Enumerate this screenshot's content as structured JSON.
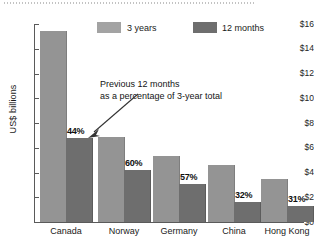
{
  "chart_data": {
    "type": "bar",
    "title": "",
    "xlabel": "",
    "ylabel": "US$ billions",
    "ylim": [
      0,
      16
    ],
    "grid": false,
    "legend_position": "top",
    "categories": [
      "Canada",
      "Norway",
      "Germany",
      "China",
      "Hong Kong"
    ],
    "series": [
      {
        "name": "3 years",
        "color": "#949494",
        "values": [
          15.4,
          6.9,
          5.35,
          4.6,
          3.5
        ]
      },
      {
        "name": "12 months",
        "color": "#6e6e6e",
        "values": [
          6.8,
          4.2,
          3.1,
          1.65,
          1.3
        ]
      }
    ],
    "data_labels": [
      "44%",
      "60%",
      "57%",
      "32%",
      "31%"
    ],
    "ytick_labels": [
      "$16",
      "$14",
      "$12",
      "$10",
      "$8",
      "$6",
      "$4",
      "$2",
      "$0"
    ],
    "ytick_values": [
      16,
      14,
      12,
      10,
      8,
      6,
      4,
      2,
      0
    ],
    "annotation": {
      "line1": "Previous 12 months",
      "line2": "as a percentage of 3-year total",
      "points_to": "44%"
    }
  },
  "legend": {
    "items": [
      {
        "label": "3 years",
        "color": "#949494"
      },
      {
        "label": "12 months",
        "color": "#6e6e6e"
      }
    ]
  },
  "axis": {
    "y_title": "US$ billions"
  }
}
